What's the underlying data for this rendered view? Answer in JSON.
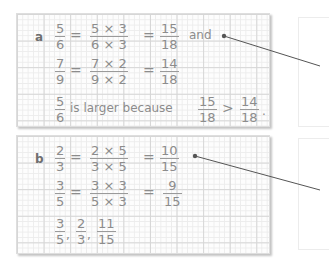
{
  "part_a": {
    "label": "a",
    "row1": {
      "lhs": {
        "num": "5",
        "den": "6"
      },
      "mid": {
        "num": "5 × 3",
        "den": "6 × 3"
      },
      "rhs": {
        "num": "15",
        "den": "18"
      },
      "suffix": "and"
    },
    "row2": {
      "lhs": {
        "num": "7",
        "den": "9"
      },
      "mid": {
        "num": "7 × 2",
        "den": "9 × 2"
      },
      "rhs": {
        "num": "14",
        "den": "18"
      }
    },
    "row3": {
      "lhs": {
        "num": "5",
        "den": "6"
      },
      "text": "is larger because",
      "f1": {
        "num": "15",
        "den": "18"
      },
      "op": ">",
      "f2": {
        "num": "14",
        "den": "18"
      },
      "end": "."
    },
    "equals": "="
  },
  "part_b": {
    "label": "b",
    "row1": {
      "lhs": {
        "num": "2",
        "den": "3"
      },
      "mid": {
        "num": "2 × 5",
        "den": "3 × 5"
      },
      "rhs": {
        "num": "10",
        "den": "15"
      }
    },
    "row2": {
      "lhs": {
        "num": "3",
        "den": "5"
      },
      "mid": {
        "num": "3 × 3",
        "den": "5 × 3"
      },
      "rhs": {
        "num": "9",
        "den": "15"
      }
    },
    "row3": {
      "f1": {
        "num": "3",
        "den": "5"
      },
      "f2": {
        "num": "2",
        "den": "3"
      },
      "f3": {
        "num": "11",
        "den": "15"
      },
      "sep": ","
    },
    "equals": "="
  },
  "colors": {
    "ink": "#8c8c8c",
    "grid_major": "#d6d6d6",
    "grid_minor": "#ececec",
    "leader": "#555555"
  }
}
